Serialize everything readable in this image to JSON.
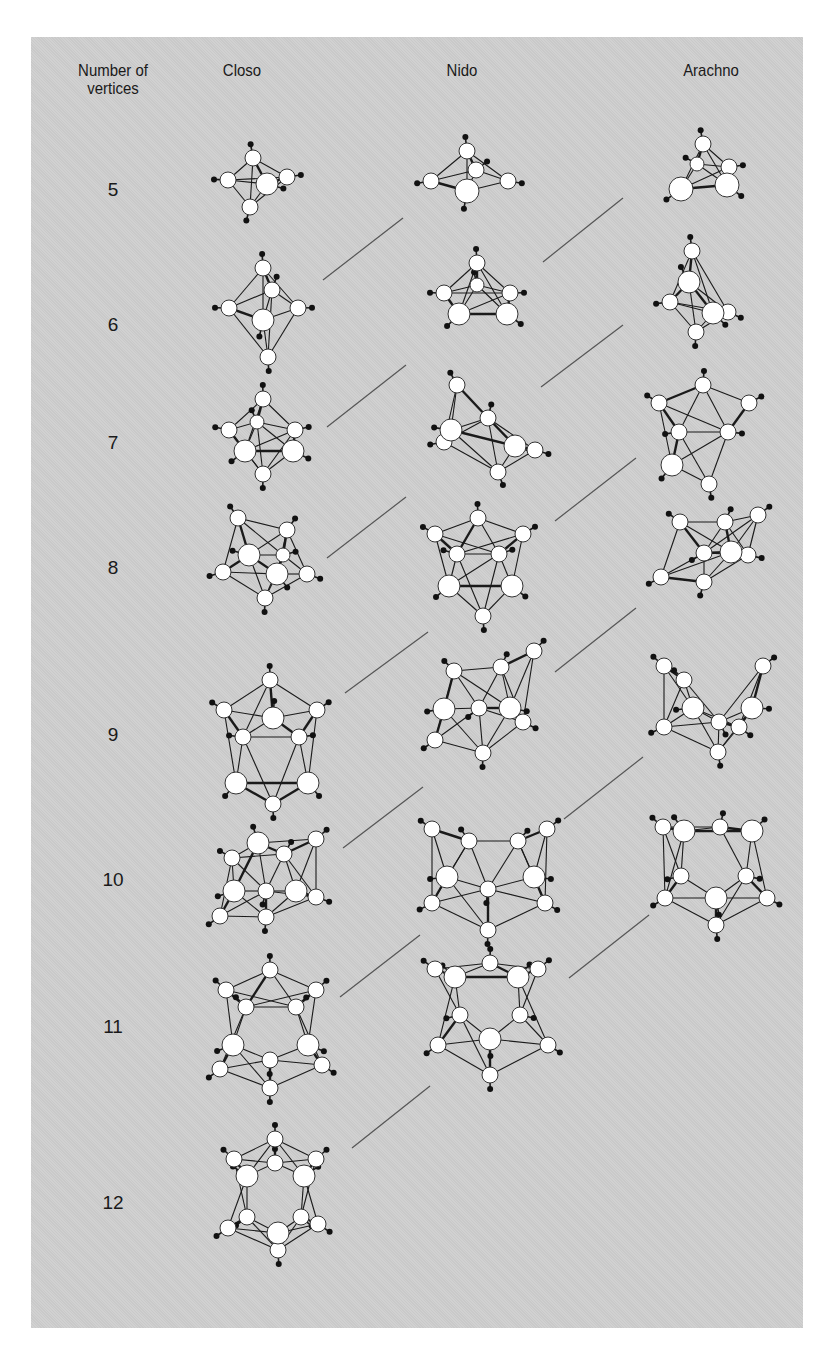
{
  "headers": {
    "vertices": "Number of vertices",
    "vertices_line1": "Number of",
    "vertices_line2": "vertices",
    "closo": "Closo",
    "nido": "Nido",
    "arachno": "Arachno"
  },
  "colors": {
    "panel": "#cfcfcf",
    "atom_fill": "#ffffff",
    "bond": "#1a1a1a",
    "hydrogen": "#111111",
    "connector": "#555555"
  },
  "rows": [
    {
      "n": "5",
      "y": 190
    },
    {
      "n": "6",
      "y": 325
    },
    {
      "n": "7",
      "y": 443
    },
    {
      "n": "8",
      "y": 568
    },
    {
      "n": "9",
      "y": 735
    },
    {
      "n": "10",
      "y": 880
    },
    {
      "n": "11",
      "y": 1027
    },
    {
      "n": "12",
      "y": 1203
    }
  ],
  "structures": [
    {
      "type": "closo",
      "n": 5,
      "cx": 253,
      "cy": 180,
      "atoms": [
        [
          0,
          -22,
          8
        ],
        [
          -25,
          0,
          8
        ],
        [
          14,
          4,
          11
        ],
        [
          34,
          -3,
          8
        ],
        [
          -3,
          27,
          8
        ]
      ]
    },
    {
      "type": "nido",
      "n": 5,
      "cx": 467,
      "cy": 178,
      "atoms": [
        [
          0,
          -27,
          8
        ],
        [
          9,
          -8,
          8
        ],
        [
          -36,
          3,
          8
        ],
        [
          0,
          13,
          12
        ],
        [
          41,
          3,
          8
        ]
      ]
    },
    {
      "type": "arachno",
      "n": 5,
      "cx": 700,
      "cy": 170,
      "atoms": [
        [
          3,
          -26,
          8
        ],
        [
          -3,
          -6,
          7
        ],
        [
          29,
          -3,
          8
        ],
        [
          -19,
          19,
          12
        ],
        [
          27,
          15,
          12
        ]
      ]
    },
    {
      "type": "closo",
      "n": 6,
      "cx": 263,
      "cy": 320,
      "atoms": [
        [
          0,
          -52,
          8
        ],
        [
          9,
          -30,
          8
        ],
        [
          -34,
          -12,
          8
        ],
        [
          35,
          -12,
          8
        ],
        [
          0,
          0,
          11
        ],
        [
          5,
          37,
          8
        ]
      ]
    },
    {
      "type": "nido",
      "n": 6,
      "cx": 477,
      "cy": 300,
      "atoms": [
        [
          0,
          -37,
          8
        ],
        [
          0,
          -15,
          7
        ],
        [
          -33,
          -7,
          8
        ],
        [
          33,
          -7,
          8
        ],
        [
          -18,
          14,
          11
        ],
        [
          30,
          14,
          11
        ]
      ]
    },
    {
      "type": "arachno",
      "n": 6,
      "cx": 690,
      "cy": 302,
      "atoms": [
        [
          2,
          -51,
          8
        ],
        [
          -1,
          -20,
          11
        ],
        [
          -20,
          0,
          8
        ],
        [
          23,
          11,
          11
        ],
        [
          38,
          10,
          8
        ],
        [
          6,
          30,
          8
        ]
      ]
    },
    {
      "type": "closo",
      "n": 7,
      "cx": 263,
      "cy": 440,
      "atoms": [
        [
          0,
          -41,
          8
        ],
        [
          -6,
          -18,
          7
        ],
        [
          -34,
          -10,
          8
        ],
        [
          32,
          -10,
          8
        ],
        [
          -18,
          11,
          11
        ],
        [
          30,
          11,
          11
        ],
        [
          0,
          34,
          8
        ]
      ]
    },
    {
      "type": "nido",
      "n": 7,
      "cx": 478,
      "cy": 425,
      "atoms": [
        [
          -21,
          -40,
          8
        ],
        [
          -27,
          5,
          11
        ],
        [
          10,
          -7,
          8
        ],
        [
          -34,
          17,
          8
        ],
        [
          37,
          21,
          11
        ],
        [
          57,
          25,
          8
        ],
        [
          20,
          47,
          8
        ]
      ]
    },
    {
      "type": "arachno",
      "n": 7,
      "cx": 703,
      "cy": 425,
      "atoms": [
        [
          0,
          -40,
          8
        ],
        [
          -44,
          -22,
          8
        ],
        [
          46,
          -22,
          8
        ],
        [
          -24,
          7,
          8
        ],
        [
          25,
          7,
          8
        ],
        [
          -31,
          40,
          11
        ],
        [
          6,
          59,
          8
        ]
      ]
    },
    {
      "type": "closo",
      "n": 8,
      "cx": 263,
      "cy": 560,
      "atoms": [
        [
          -25,
          -42,
          8
        ],
        [
          24,
          -30,
          8
        ],
        [
          -14,
          -5,
          11
        ],
        [
          20,
          -5,
          7
        ],
        [
          -40,
          12,
          8
        ],
        [
          14,
          14,
          11
        ],
        [
          44,
          14,
          8
        ],
        [
          2,
          38,
          8
        ]
      ]
    },
    {
      "type": "nido",
      "n": 8,
      "cx": 478,
      "cy": 558,
      "atoms": [
        [
          0,
          -40,
          8
        ],
        [
          -43,
          -24,
          8
        ],
        [
          45,
          -24,
          8
        ],
        [
          -21,
          -4,
          8
        ],
        [
          21,
          -4,
          8
        ],
        [
          -29,
          28,
          11
        ],
        [
          34,
          28,
          11
        ],
        [
          5,
          58,
          8
        ]
      ]
    },
    {
      "type": "arachno",
      "n": 8,
      "cx": 710,
      "cy": 565,
      "atoms": [
        [
          -30,
          -43,
          8
        ],
        [
          15,
          -43,
          8
        ],
        [
          48,
          -50,
          8
        ],
        [
          -6,
          -12,
          8
        ],
        [
          21,
          -13,
          11
        ],
        [
          38,
          -10,
          8
        ],
        [
          -49,
          12,
          8
        ],
        [
          -6,
          17,
          8
        ]
      ]
    },
    {
      "type": "closo",
      "n": 9,
      "cx": 270,
      "cy": 750,
      "atoms": [
        [
          0,
          -70,
          8
        ],
        [
          -46,
          -40,
          8
        ],
        [
          3,
          -32,
          11
        ],
        [
          47,
          -40,
          8
        ],
        [
          -27,
          -13,
          8
        ],
        [
          29,
          -13,
          8
        ],
        [
          -34,
          33,
          11
        ],
        [
          38,
          33,
          11
        ],
        [
          3,
          54,
          8
        ]
      ]
    },
    {
      "type": "nido",
      "n": 9,
      "cx": 478,
      "cy": 730,
      "atoms": [
        [
          -24,
          -59,
          8
        ],
        [
          23,
          -63,
          8
        ],
        [
          56,
          -79,
          8
        ],
        [
          -34,
          -21,
          11
        ],
        [
          1,
          -22,
          8
        ],
        [
          32,
          -22,
          11
        ],
        [
          45,
          -8,
          8
        ],
        [
          -43,
          10,
          8
        ],
        [
          5,
          23,
          8
        ]
      ]
    },
    {
      "type": "arachno",
      "n": 9,
      "cx": 713,
      "cy": 715,
      "atoms": [
        [
          -49,
          -49,
          8
        ],
        [
          -29,
          -35,
          8
        ],
        [
          50,
          -49,
          8
        ],
        [
          -20,
          -7,
          11
        ],
        [
          39,
          -7,
          11
        ],
        [
          -49,
          12,
          8
        ],
        [
          6,
          7,
          8
        ],
        [
          26,
          12,
          8
        ],
        [
          5,
          37,
          8
        ]
      ]
    },
    {
      "type": "closo",
      "n": 10,
      "cx": 270,
      "cy": 880,
      "atoms": [
        [
          -12,
          -37,
          11
        ],
        [
          46,
          -41,
          8
        ],
        [
          -38,
          -22,
          8
        ],
        [
          14,
          -26,
          8
        ],
        [
          -36,
          11,
          11
        ],
        [
          -4,
          11,
          8
        ],
        [
          26,
          11,
          11
        ],
        [
          46,
          17,
          8
        ],
        [
          -50,
          36,
          8
        ],
        [
          -4,
          37,
          8
        ]
      ]
    },
    {
      "type": "nido",
      "n": 10,
      "cx": 488,
      "cy": 870,
      "atoms": [
        [
          -56,
          -41,
          8
        ],
        [
          -19,
          -29,
          8
        ],
        [
          30,
          -29,
          8
        ],
        [
          59,
          -41,
          8
        ],
        [
          -41,
          7,
          11
        ],
        [
          46,
          7,
          11
        ],
        [
          0,
          19,
          8
        ],
        [
          -56,
          33,
          8
        ],
        [
          57,
          33,
          8
        ],
        [
          0,
          60,
          8
        ]
      ]
    },
    {
      "type": "arachno",
      "n": 10,
      "cx": 713,
      "cy": 870,
      "atoms": [
        [
          -50,
          -43,
          8
        ],
        [
          -29,
          -39,
          11
        ],
        [
          7,
          -43,
          8
        ],
        [
          39,
          -39,
          11
        ],
        [
          -32,
          6,
          8
        ],
        [
          33,
          6,
          8
        ],
        [
          -48,
          28,
          8
        ],
        [
          3,
          28,
          11
        ],
        [
          54,
          28,
          8
        ],
        [
          3,
          55,
          8
        ]
      ]
    },
    {
      "type": "closo",
      "n": 11,
      "cx": 270,
      "cy": 1040,
      "atoms": [
        [
          0,
          -70,
          8
        ],
        [
          -44,
          -50,
          8
        ],
        [
          46,
          -50,
          8
        ],
        [
          -24,
          -33,
          8
        ],
        [
          26,
          -33,
          8
        ],
        [
          -37,
          5,
          11
        ],
        [
          38,
          5,
          11
        ],
        [
          0,
          20,
          8
        ],
        [
          -50,
          29,
          8
        ],
        [
          52,
          25,
          8
        ],
        [
          0,
          48,
          8
        ]
      ]
    },
    {
      "type": "nido",
      "n": 11,
      "cx": 490,
      "cy": 1035,
      "atoms": [
        [
          -55,
          -66,
          8
        ],
        [
          -35,
          -58,
          11
        ],
        [
          0,
          -72,
          8
        ],
        [
          28,
          -58,
          11
        ],
        [
          48,
          -66,
          8
        ],
        [
          -30,
          -20,
          8
        ],
        [
          30,
          -20,
          8
        ],
        [
          -52,
          10,
          8
        ],
        [
          0,
          4,
          11
        ],
        [
          58,
          10,
          8
        ],
        [
          0,
          40,
          8
        ]
      ]
    },
    {
      "type": "closo",
      "n": 12,
      "cx": 275,
      "cy": 1205,
      "atoms": [
        [
          0,
          -66,
          8
        ],
        [
          -41,
          -46,
          8
        ],
        [
          0,
          -42,
          8
        ],
        [
          41,
          -46,
          8
        ],
        [
          -28,
          -29,
          11
        ],
        [
          29,
          -29,
          11
        ],
        [
          -28,
          12,
          8
        ],
        [
          26,
          12,
          8
        ],
        [
          -47,
          23,
          8
        ],
        [
          3,
          28,
          11
        ],
        [
          43,
          19,
          8
        ],
        [
          3,
          45,
          8
        ]
      ]
    }
  ],
  "connectors": [
    [
      323,
      280,
      403,
      218
    ],
    [
      543,
      262,
      623,
      198
    ],
    [
      327,
      427,
      406,
      365
    ],
    [
      541,
      387,
      623,
      325
    ],
    [
      327,
      558,
      406,
      497
    ],
    [
      555,
      521,
      636,
      458
    ],
    [
      345,
      693,
      428,
      632
    ],
    [
      555,
      672,
      636,
      608
    ],
    [
      343,
      848,
      423,
      787
    ],
    [
      564,
      819,
      643,
      757
    ],
    [
      340,
      997,
      420,
      935
    ],
    [
      569,
      978,
      649,
      915
    ],
    [
      352,
      1148,
      430,
      1086
    ]
  ]
}
